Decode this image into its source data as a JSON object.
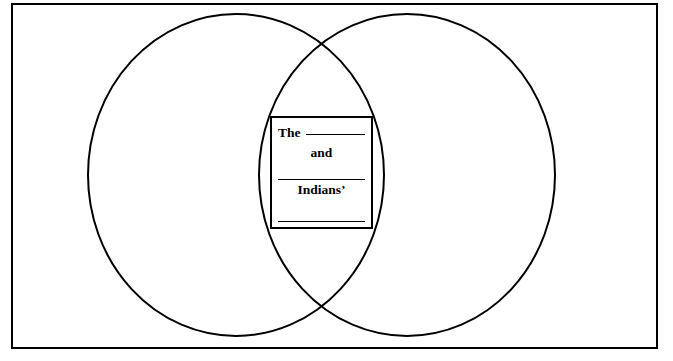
{
  "page": {
    "background_color": "#ffffff",
    "stroke_color": "#000000",
    "clipped_header_text": "......."
  },
  "frame": {
    "name": "outer-border"
  },
  "venn": {
    "left_circle_label": "",
    "right_circle_label": "",
    "overlap_label": ""
  },
  "answer_box": {
    "line1_word": "The",
    "line1_blank": "",
    "line2_word": "and",
    "line3_blank": "",
    "line4_word": "Indians’",
    "line5_blank": ""
  }
}
